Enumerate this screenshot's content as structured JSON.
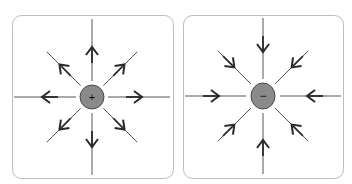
{
  "diagram": {
    "panels": [
      {
        "id": "positive",
        "charge_symbol": "+",
        "field_direction": "outward",
        "line_count": 8,
        "charge_fill": "#8a8a8a"
      },
      {
        "id": "negative",
        "charge_symbol": "−",
        "field_direction": "inward",
        "line_count": 8,
        "charge_fill": "#8a8a8a"
      }
    ],
    "colors": {
      "line": "#555555",
      "arrow": "#2a2a2a",
      "frame": "#bdbdbd",
      "charge_stroke": "#4a4a4a"
    }
  }
}
